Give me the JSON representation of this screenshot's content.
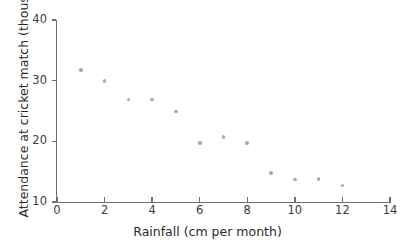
{
  "chart_data": {
    "type": "scatter",
    "title": "",
    "xlabel": "Rainfall (cm per month)",
    "ylabel": "Attendance at cricket match (thousands)",
    "xlim": [
      0,
      14
    ],
    "ylim": [
      10,
      40
    ],
    "xticks": [
      0,
      2,
      4,
      6,
      8,
      10,
      12,
      14
    ],
    "yticks": [
      10,
      20,
      30,
      40
    ],
    "xtick_labels": [
      "0",
      "2",
      "4",
      "6",
      "8",
      "10",
      "12",
      "14"
    ],
    "ytick_labels": [
      "10",
      "20",
      "30",
      "40"
    ],
    "grid": false,
    "legend": false,
    "marker_color": "#a9a9a9",
    "axis_color": "#6e6e6e",
    "series": [
      {
        "name": "Attendance vs rainfall",
        "x": [
          1,
          2,
          3,
          4,
          5,
          6,
          7,
          8,
          9,
          10,
          11,
          12
        ],
        "y": [
          31.8,
          29.9,
          26.9,
          26.9,
          24.9,
          19.7,
          20.7,
          19.7,
          14.8,
          13.7,
          13.8,
          12.7
        ],
        "points": [
          {
            "x": 1,
            "y": 31.8
          },
          {
            "x": 2,
            "y": 29.9
          },
          {
            "x": 3,
            "y": 26.9
          },
          {
            "x": 4,
            "y": 26.9
          },
          {
            "x": 5,
            "y": 24.9
          },
          {
            "x": 6,
            "y": 19.7
          },
          {
            "x": 7,
            "y": 20.7
          },
          {
            "x": 8,
            "y": 19.7
          },
          {
            "x": 9,
            "y": 14.8
          },
          {
            "x": 10,
            "y": 13.7
          },
          {
            "x": 11,
            "y": 13.8
          },
          {
            "x": 12,
            "y": 12.7
          }
        ]
      }
    ]
  }
}
